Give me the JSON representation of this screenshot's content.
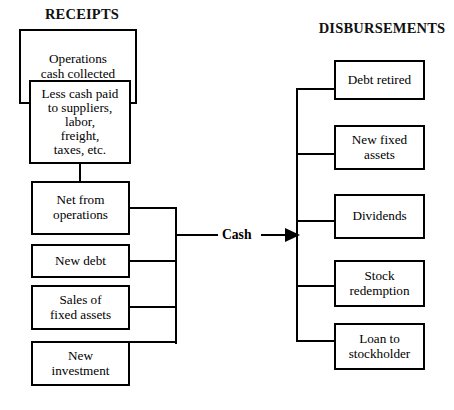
{
  "diagram": {
    "headers": {
      "left": "RECEIPTS",
      "right": "DISBURSEMENTS"
    },
    "flow_label": "Cash",
    "accent_color": "#000000",
    "background_color": "#ffffff",
    "receipts": {
      "nested": {
        "outer": "Operations\ncash collected",
        "outer_line1": "Operations",
        "outer_line2": "cash collected",
        "inner_line1": "Less cash paid",
        "inner_line2": "to suppliers,",
        "inner_line3": "labor,",
        "inner_line4": "freight,",
        "inner_line5": "taxes, etc."
      },
      "items": [
        {
          "line1": "Net from",
          "line2": "operations"
        },
        {
          "line1": "New debt",
          "line2": ""
        },
        {
          "line1": "Sales of",
          "line2": "fixed assets"
        },
        {
          "line1": "New",
          "line2": "investment"
        }
      ]
    },
    "disbursements": {
      "items": [
        {
          "line1": "Debt retired",
          "line2": ""
        },
        {
          "line1": "New fixed",
          "line2": "assets"
        },
        {
          "line1": "Dividends",
          "line2": ""
        },
        {
          "line1": "Stock",
          "line2": "redemption"
        },
        {
          "line1": "Loan to",
          "line2": "stockholder"
        }
      ]
    }
  }
}
